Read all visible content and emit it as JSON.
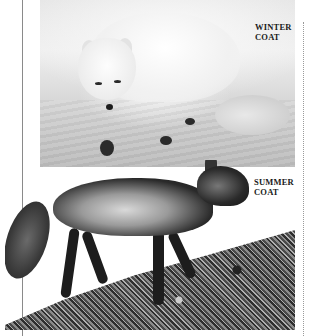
{
  "photos": [
    {
      "id": "winter",
      "subject": "Arctic fox in white winter coat walking on snow"
    },
    {
      "id": "summer",
      "subject": "Arctic fox in dark summer coat on rocky ground"
    }
  ],
  "labels": {
    "winter": {
      "line1": "WINTER",
      "line2": "COAT"
    },
    "summer": {
      "line1": "SUMMER",
      "line2": "COAT"
    }
  }
}
